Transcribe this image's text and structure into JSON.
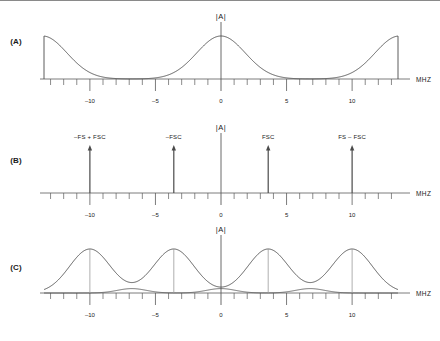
{
  "figure": {
    "width": 440,
    "height": 341,
    "background": "#ffffff",
    "line_color": "#4a4a4a",
    "axis_color": "#5a5a5a",
    "text_color": "#1a1a1a",
    "marker_color": "#9a9a9a",
    "top_rule_color": "#8a8a8a"
  },
  "panels": [
    {
      "id": "A",
      "label": "(A)",
      "axis_title": "|A|",
      "unit": "MHZ",
      "label_x": 16,
      "label_y": 44,
      "baseline_y": 79,
      "axis_top_y": 22,
      "tick_labels": [
        {
          "text": "–10",
          "value": -10
        },
        {
          "text": "–5",
          "value": -5
        },
        {
          "text": "0",
          "value": 0
        },
        {
          "text": "5",
          "value": 5
        },
        {
          "text": "10",
          "value": 10
        }
      ]
    },
    {
      "id": "B",
      "label": "(B)",
      "axis_title": "|A|",
      "unit": "MHZ",
      "label_x": 16,
      "label_y": 163,
      "baseline_y": 193,
      "axis_top_y": 133,
      "tick_labels": [
        {
          "text": "–10",
          "value": -10
        },
        {
          "text": "–5",
          "value": -5
        },
        {
          "text": "0",
          "value": 0
        },
        {
          "text": "5",
          "value": 5
        },
        {
          "text": "10",
          "value": 10
        }
      ],
      "arrows": [
        {
          "label": "–FS + FSC",
          "value": -10.0
        },
        {
          "label": "–FSC",
          "value": -3.6
        },
        {
          "label": "FSC",
          "value": 3.6
        },
        {
          "label": "FS – FSC",
          "value": 10.0
        }
      ]
    },
    {
      "id": "C",
      "label": "(C)",
      "axis_title": "|A|",
      "unit": "MHZ",
      "label_x": 16,
      "label_y": 270,
      "baseline_y": 293,
      "axis_top_y": 235,
      "tick_labels": [
        {
          "text": "–10",
          "value": -10
        },
        {
          "text": "–5",
          "value": -5
        },
        {
          "text": "0",
          "value": 0
        },
        {
          "text": "5",
          "value": 5
        },
        {
          "text": "10",
          "value": 10
        }
      ]
    }
  ],
  "chart_data": {
    "type": "line",
    "title": "",
    "xlabel": "MHZ",
    "ylabel": "|A|",
    "xlim": [
      -13.5,
      13.5
    ],
    "grid": false,
    "legend": "none",
    "axis_ticks": {
      "major": [
        -10,
        -5,
        0,
        5,
        10
      ],
      "minor_step": 1,
      "minor_range": [
        -13,
        13
      ]
    },
    "panels": [
      {
        "id": "A",
        "description": "Baseband spectrum with aliased replicas at sampling frequency, truncated at plot edges",
        "series": [
          {
            "name": "spectrum",
            "type": "gaussian-sum",
            "components": [
              {
                "center": 0.0,
                "amplitude": 1.0,
                "sigma": 1.85
              },
              {
                "center": -13.6,
                "amplitude": 1.0,
                "sigma": 1.85
              },
              {
                "center": 13.6,
                "amplitude": 1.0,
                "sigma": 1.85
              }
            ]
          }
        ],
        "truncated_edges": [
          -13.6,
          13.6
        ]
      },
      {
        "id": "B",
        "description": "Line spectrum of chroma subcarrier and its sampling-frequency images",
        "series": [
          {
            "name": "impulses",
            "type": "impulse",
            "x": [
              -10.0,
              -3.6,
              3.6,
              10.0
            ],
            "values": [
              1.0,
              1.0,
              1.0,
              1.0
            ],
            "labels": [
              "–FS + FSC",
              "–FSC",
              "FSC",
              "FS – FSC"
            ]
          }
        ]
      },
      {
        "id": "C",
        "description": "Chroma sidebands around each subcarrier image, with low-amplitude overlap lobes",
        "series": [
          {
            "name": "chroma-bands",
            "type": "gaussian-sum",
            "components": [
              {
                "center": -10.0,
                "amplitude": 1.0,
                "sigma": 1.55
              },
              {
                "center": -3.6,
                "amplitude": 1.0,
                "sigma": 1.55
              },
              {
                "center": 3.6,
                "amplitude": 1.0,
                "sigma": 1.55
              },
              {
                "center": 10.0,
                "amplitude": 1.0,
                "sigma": 1.55
              }
            ]
          },
          {
            "name": "overlap-lobes",
            "type": "gaussian-sum",
            "components": [
              {
                "center": -6.8,
                "amplitude": 0.1,
                "sigma": 1.1
              },
              {
                "center": 0.0,
                "amplitude": 0.1,
                "sigma": 1.1
              },
              {
                "center": 6.8,
                "amplitude": 0.1,
                "sigma": 1.1
              }
            ]
          }
        ],
        "peak_markers": [
          -10.0,
          -3.6,
          3.6,
          10.0
        ]
      }
    ]
  }
}
